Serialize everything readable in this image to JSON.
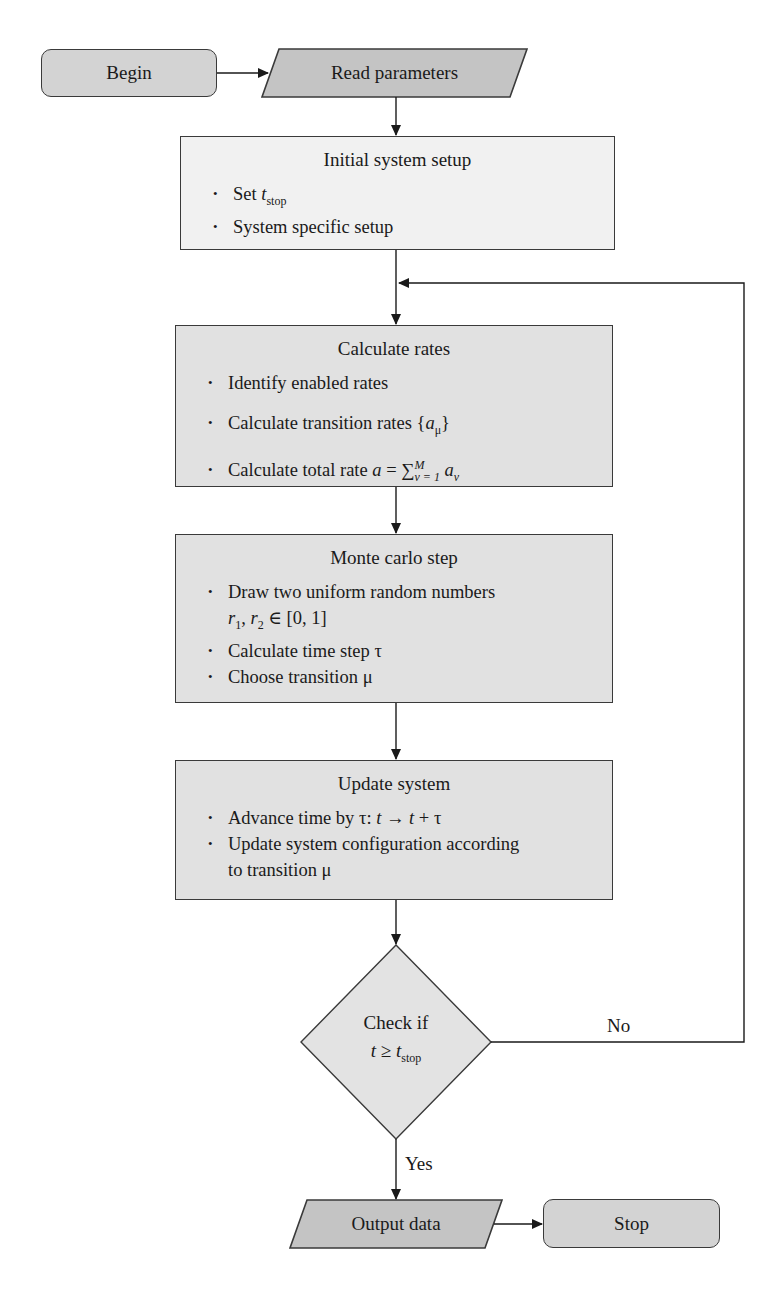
{
  "diagram": {
    "type": "flowchart",
    "colors": {
      "terminal_fill": "#d3d3d3",
      "io_fill": "#c4c4c4",
      "setup_fill": "#f1f1f1",
      "process_fill": "#e1e1e1",
      "decision_fill": "#e3e3e3",
      "stroke": "#3a3a3a"
    },
    "nodes": {
      "begin": {
        "label": "Begin",
        "shape": "rounded-rectangle"
      },
      "read_params": {
        "label": "Read parameters",
        "shape": "parallelogram"
      },
      "initial_setup": {
        "title": "Initial system setup",
        "bullets": [
          {
            "text": "Set ",
            "var": "t",
            "sub": "stop"
          },
          {
            "text": "System specific setup"
          }
        ]
      },
      "calc_rates": {
        "title": "Calculate rates",
        "bullets": [
          {
            "text": "Identify enabled rates"
          },
          {
            "text": "Calculate transition rates {",
            "var": "a",
            "sub": "μ",
            "suffix": "}"
          },
          {
            "text": "Calculate total rate ",
            "var": "a",
            "eq": " = ∑",
            "sup": "M",
            "sub": "ν = 1",
            "term": "a",
            "term_sub": "ν"
          }
        ]
      },
      "monte_carlo": {
        "title": "Monte carlo step",
        "bullets": [
          {
            "text": "Draw two uniform random numbers"
          },
          {
            "text": "r1, r2 ∈ [0, 1]",
            "continuation": true
          },
          {
            "text": "Calculate time step τ"
          },
          {
            "text": "Choose transition μ"
          }
        ]
      },
      "update_system": {
        "title": "Update system",
        "bullets": [
          {
            "text": "Advance time by τ: ",
            "expr": "t → t + τ"
          },
          {
            "text": "Update system configuration according"
          },
          {
            "text": "to transition μ",
            "continuation": true
          }
        ]
      },
      "decision": {
        "label_line1": "Check if",
        "var": "t",
        "op": " ≥ ",
        "var2": "t",
        "sub": "stop",
        "shape": "diamond"
      },
      "output": {
        "label": "Output data",
        "shape": "parallelogram"
      },
      "stop": {
        "label": "Stop",
        "shape": "rounded-rectangle"
      }
    },
    "edges": {
      "no_label": "No",
      "yes_label": "Yes"
    }
  }
}
